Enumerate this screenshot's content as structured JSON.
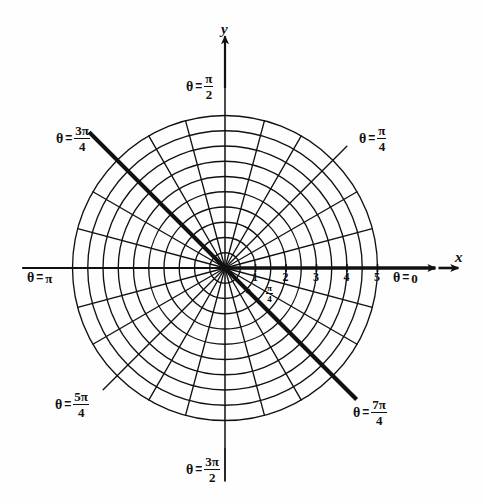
{
  "figure": {
    "kind": "polar-coordinate-grid",
    "background_color": "#fefefe",
    "ink_color": "#111111"
  },
  "axes": {
    "x_label": "x",
    "y_label": "y",
    "x_arrow": "arrow-right",
    "y_arrow": "arrow-up"
  },
  "angle_labels": [
    {
      "id": "theta-0",
      "theta_symbol": "θ",
      "equals": "=",
      "value_plain": "0",
      "numerator": "",
      "denominator": "",
      "kind": "plain",
      "degrees": 0
    },
    {
      "id": "theta-pi-4",
      "theta_symbol": "θ",
      "equals": "=",
      "value_plain": "",
      "numerator": "π",
      "denominator": "4",
      "kind": "fraction",
      "degrees": 45
    },
    {
      "id": "theta-pi-2",
      "theta_symbol": "θ",
      "equals": "=",
      "value_plain": "",
      "numerator": "π",
      "denominator": "2",
      "kind": "fraction",
      "degrees": 90
    },
    {
      "id": "theta-3pi-4",
      "theta_symbol": "θ",
      "equals": "=",
      "value_plain": "",
      "numerator": "3π",
      "denominator": "4",
      "kind": "fraction",
      "degrees": 135
    },
    {
      "id": "theta-pi",
      "theta_symbol": "θ",
      "equals": "=",
      "value_plain": "π",
      "numerator": "",
      "denominator": "",
      "kind": "plain",
      "degrees": 180
    },
    {
      "id": "theta-5pi-4",
      "theta_symbol": "θ",
      "equals": "=",
      "value_plain": "",
      "numerator": "5π",
      "denominator": "4",
      "kind": "fraction",
      "degrees": 225
    },
    {
      "id": "theta-3pi-2",
      "theta_symbol": "θ",
      "equals": "=",
      "value_plain": "",
      "numerator": "3π",
      "denominator": "2",
      "kind": "fraction",
      "degrees": 270
    },
    {
      "id": "theta-7pi-4",
      "theta_symbol": "θ",
      "equals": "=",
      "value_plain": "",
      "numerator": "7π",
      "denominator": "4",
      "kind": "fraction",
      "degrees": 315
    }
  ],
  "radial_ticks": [
    "1",
    "2",
    "3",
    "4",
    "5"
  ],
  "center_annotation": {
    "numerator": "π",
    "denominator": "4",
    "points_to_degrees": -45
  },
  "chart_data": {
    "type": "polar-grid",
    "title": "",
    "center": {
      "x": 225,
      "y": 268
    },
    "unit_px": 30.5,
    "r_max": 5,
    "circle_radii": [
      0.5,
      1,
      1.5,
      2,
      2.5,
      3,
      3.5,
      4,
      4.5,
      5
    ],
    "labeled_radii": [
      1,
      2,
      3,
      4,
      5
    ],
    "ray_spacing_degrees": 15,
    "ray_count": 24,
    "emphasized_rays_degrees": [
      0,
      135,
      315
    ],
    "emphasized_line_note": "bold diameter through 3pi/4 and 7pi/4, plus bold x-axis",
    "grid": true,
    "legend": "none"
  }
}
